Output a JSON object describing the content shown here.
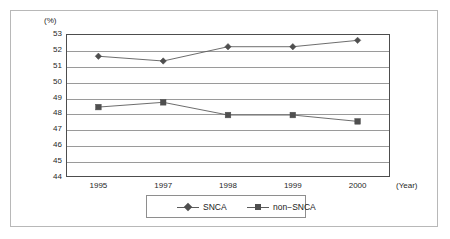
{
  "chart_data": {
    "type": "line",
    "title": "",
    "subtitle": "",
    "xlabel": "(Year)",
    "ylabel": "(%)",
    "categories": [
      "1995",
      "1997",
      "1998",
      "1999",
      "2000"
    ],
    "series": [
      {
        "name": "SNCA",
        "marker": "diamond",
        "values": [
          51.6,
          51.3,
          52.2,
          52.2,
          52.6
        ]
      },
      {
        "name": "non-SNCA",
        "marker": "square",
        "values": [
          48.4,
          48.7,
          47.9,
          47.9,
          47.5
        ]
      }
    ],
    "ylim": [
      44,
      53
    ],
    "ytick_labels": [
      "53",
      "52",
      "51",
      "50",
      "49",
      "48",
      "47",
      "46",
      "45",
      "44"
    ],
    "ytick_values": [
      53,
      52,
      51,
      50,
      49,
      48,
      47,
      46,
      45,
      44
    ],
    "grid": true,
    "legend_position": "bottom-center",
    "colors": {
      "line": "#5c5c5c",
      "marker": "#4f4f4f",
      "grid": "#9a9a9a",
      "axis": "#4d4d4d",
      "text": "#1f1f1f",
      "frame": "#b8b8b8"
    }
  },
  "axes": {
    "unit_label": "(%)",
    "x_unit_label": "(Year)"
  },
  "legend": {
    "entries": [
      {
        "label": "SNCA"
      },
      {
        "label": "non−SNCA"
      }
    ]
  }
}
